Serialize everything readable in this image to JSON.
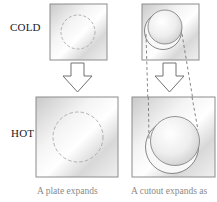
{
  "labels": {
    "cold": "COLD",
    "hot": "HOT"
  },
  "captions": {
    "left": "A plate expands",
    "right": "A cutout expands as"
  },
  "colors": {
    "plate_border": "#8c8c8c",
    "plate_light": "#ffffff",
    "plate_mid": "#e6e6e6",
    "plate_dark": "#c4c4c4",
    "dashed_circle": "#a8a8a8",
    "arrow_stroke": "#707070",
    "guide_lines": "#6a6a6a",
    "caption_text": "#8a8a8a"
  },
  "panels": [
    {
      "id": "plate-cold",
      "state": "cold",
      "type": "solid plate with marked circle"
    },
    {
      "id": "cutout-cold",
      "state": "cold",
      "type": "plate with circular cutout"
    },
    {
      "id": "plate-hot",
      "state": "hot",
      "type": "solid plate with marked circle"
    },
    {
      "id": "cutout-hot",
      "state": "hot",
      "type": "plate with circular cutout"
    }
  ]
}
